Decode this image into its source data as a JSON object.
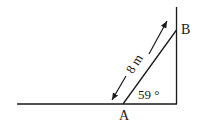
{
  "diagram": {
    "type": "ladder-against-wall",
    "points": {
      "A": {
        "label": "A"
      },
      "B": {
        "label": "B"
      }
    },
    "ladder_length_label": "8 m",
    "angle_label": "59 °",
    "colors": {
      "line": "#1a1a1a",
      "background": "#ffffff"
    }
  }
}
